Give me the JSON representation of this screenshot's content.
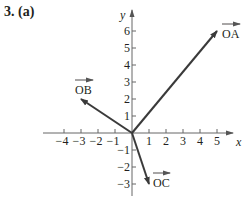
{
  "problem_label": "3. (a)",
  "axes": {
    "x_label": "x",
    "y_label": "y",
    "x_ticks": [
      "−4",
      "−3",
      "−2",
      "−1",
      "1",
      "2",
      "3",
      "4",
      "5"
    ],
    "y_ticks": [
      "6",
      "5",
      "4",
      "3",
      "2",
      "1",
      "−1",
      "−2",
      "−3"
    ]
  },
  "vectors": [
    {
      "name": "OA",
      "label": "OA",
      "x": 5,
      "y": 6
    },
    {
      "name": "OB",
      "label": "OB",
      "x": -3,
      "y": 2
    },
    {
      "name": "OC",
      "label": "OC",
      "x": 1,
      "y": -3
    }
  ],
  "colors": {
    "ink": "#231f20",
    "axis": "#555555",
    "vector": "#3a3a3a"
  }
}
